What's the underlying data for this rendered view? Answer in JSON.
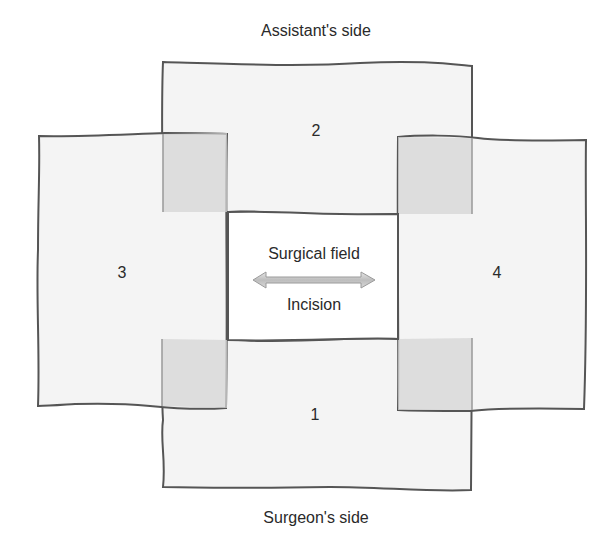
{
  "labels": {
    "top_side": "Assistant's side",
    "bottom_side": "Surgeon's side",
    "field": "Surgical field",
    "incision": "Incision"
  },
  "towels": [
    {
      "number": "1",
      "position": "bottom"
    },
    {
      "number": "2",
      "position": "top"
    },
    {
      "number": "3",
      "position": "left"
    },
    {
      "number": "4",
      "position": "right"
    }
  ],
  "colors": {
    "towel_fill": "#f4f4f4",
    "overlap_fill": "#dcdcdc",
    "outline": "#555555",
    "arrow_fill": "#c8c8c8",
    "text": "#2a2a2a"
  }
}
